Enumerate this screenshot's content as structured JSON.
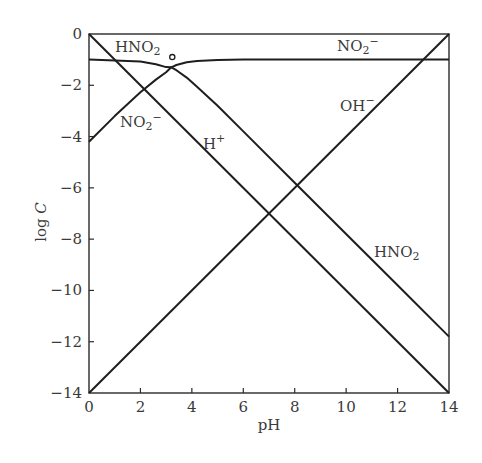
{
  "chart_data": {
    "type": "line",
    "title": "",
    "xlabel": "pH",
    "ylabel": "log C",
    "xlim": [
      0,
      14
    ],
    "ylim": [
      -14,
      0
    ],
    "grid": false,
    "legend": "inline labels",
    "xticks": [
      0,
      2,
      4,
      6,
      8,
      10,
      12,
      14
    ],
    "yticks": [
      0,
      -2,
      -4,
      -6,
      -8,
      -10,
      -12,
      -14
    ],
    "xtick_labels": [
      "0",
      "2",
      "4",
      "6",
      "8",
      "10",
      "12",
      "14"
    ],
    "ytick_labels": [
      "0",
      "−2",
      "−4",
      "−6",
      "−8",
      "−10",
      "−12",
      "−14"
    ],
    "pKa": 3.2,
    "log_total_concentration": -1,
    "series": [
      {
        "name": "H+",
        "x": [
          0,
          14
        ],
        "y": [
          0,
          -14
        ]
      },
      {
        "name": "OH-",
        "x": [
          0,
          14
        ],
        "y": [
          -14,
          0
        ]
      },
      {
        "name": "HNO2",
        "x": [
          0,
          1,
          2,
          2.6,
          3.0,
          3.2,
          3.4,
          3.8,
          4.2,
          5,
          6,
          8,
          10,
          12,
          14
        ],
        "y": [
          -1.0,
          -1.03,
          -1.07,
          -1.18,
          -1.29,
          -1.3,
          -1.41,
          -1.7,
          -2.06,
          -2.8,
          -3.8,
          -5.8,
          -7.8,
          -9.8,
          -11.8
        ]
      },
      {
        "name": "NO2-",
        "x": [
          0,
          1,
          2,
          2.6,
          3.0,
          3.2,
          3.4,
          3.8,
          4.2,
          5,
          6,
          8,
          10,
          12,
          14
        ],
        "y": [
          -4.2,
          -3.2,
          -2.27,
          -1.78,
          -1.49,
          -1.3,
          -1.21,
          -1.1,
          -1.05,
          -1.01,
          -1.0,
          -1.0,
          -1.0,
          -1.0,
          -1.0
        ]
      }
    ],
    "annotations": [
      {
        "text": "HNO₂",
        "x": 1.0,
        "y": -0.6
      },
      {
        "text": "NO₂⁻",
        "x": 10.1,
        "y": -0.55
      },
      {
        "text": "NO₂⁻",
        "x": 1.2,
        "y": -3.6
      },
      {
        "text": "H⁺",
        "x": 4.5,
        "y": -4.4
      },
      {
        "text": "OH⁻",
        "x": 9.0,
        "y": -3.0
      },
      {
        "text": "HNO₂",
        "x": 11.0,
        "y": -8.6
      },
      {
        "text": "○ pKa point",
        "x": 3.2,
        "y": -0.9
      }
    ]
  },
  "axes": {
    "x_label": "pH",
    "y_label_prefix": "log ",
    "y_label_var": "C"
  },
  "labels": {
    "top_hno2_main": "HNO",
    "top_hno2_sub": "2",
    "top_no2_main": "NO",
    "top_no2_sub": "2",
    "top_no2_sup": "−",
    "left_no2_main": "NO",
    "left_no2_sub": "2",
    "left_no2_sup": "−",
    "h_main": "H",
    "h_sup": "+",
    "oh_main": "OH",
    "oh_sup": "−",
    "right_hno2_main": "HNO",
    "right_hno2_sub": "2"
  }
}
